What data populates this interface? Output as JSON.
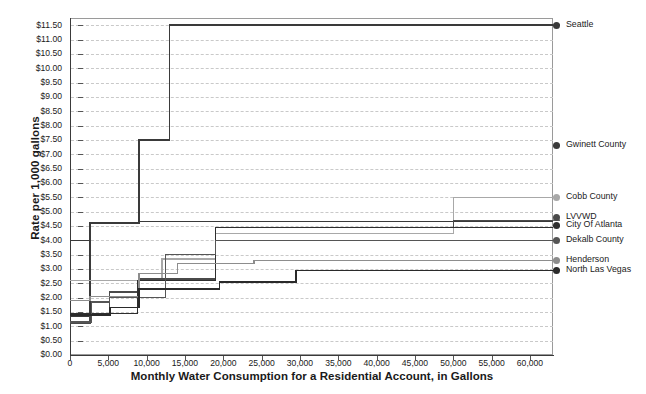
{
  "chart_data": {
    "type": "line",
    "title": "",
    "xlabel": "Monthly Water Consumption for a Residential Account, in Gallons",
    "ylabel": "Rate per 1,000 gallons",
    "xlim": [
      0,
      63000
    ],
    "ylim": [
      0,
      11.75
    ],
    "grid": true,
    "legend_position": "right",
    "step_style": "post",
    "x_ticks": [
      0,
      5000,
      10000,
      15000,
      20000,
      25000,
      30000,
      35000,
      40000,
      45000,
      50000,
      55000,
      60000
    ],
    "x_tick_labels": [
      "0",
      "5,000",
      "10,000",
      "15,000",
      "20,000",
      "25,000",
      "30,000",
      "35,000",
      "40,000",
      "45,000",
      "50,000",
      "55,000",
      "60,000"
    ],
    "y_ticks": [
      0,
      0.5,
      1,
      1.5,
      2,
      2.5,
      3,
      3.5,
      4,
      4.5,
      5,
      5.5,
      6,
      6.5,
      7,
      7.5,
      8,
      8.5,
      9,
      9.5,
      10,
      10.5,
      11,
      11.5
    ],
    "y_tick_labels": [
      "$0.00",
      "$0.50",
      "$1.00",
      "$1.50",
      "$2.00",
      "$2.50",
      "$3.00",
      "$3.50",
      "$4.00",
      "$4.50",
      "$5.00",
      "$5.50",
      "$6.00",
      "$6.50",
      "$7.00",
      "$7.50",
      "$8.00",
      "$8.50",
      "$9.00",
      "$9.50",
      "$10.00",
      "$10.50",
      "$11.00",
      "$11.50"
    ],
    "series": [
      {
        "name": "Seattle",
        "color": "#3a3a3a",
        "width": 1.5,
        "end_value": 11.5,
        "points": [
          [
            0,
            4.0
          ],
          [
            2600,
            4.0
          ],
          [
            2600,
            4.6
          ],
          [
            9000,
            4.6
          ],
          [
            9000,
            7.5
          ],
          [
            13000,
            7.5
          ],
          [
            13000,
            11.5
          ],
          [
            63000,
            11.5
          ]
        ]
      },
      {
        "name": "Gwinett County",
        "color": "#3a3a3a",
        "width": 1.5,
        "end_value": 7.3,
        "points": [
          [
            0,
            1.35
          ],
          [
            2600,
            1.35
          ],
          [
            2600,
            4.6
          ],
          [
            9000,
            4.6
          ],
          [
            9000,
            4.65
          ],
          [
            63000,
            4.65
          ]
        ]
      },
      {
        "name": "Cobb County",
        "color": "#a8a8a8",
        "width": 1.2,
        "end_value": 5.5,
        "points": [
          [
            0,
            2.6
          ],
          [
            1200,
            2.6
          ],
          [
            1200,
            2.6
          ],
          [
            12000,
            2.6
          ],
          [
            12000,
            3.35
          ],
          [
            19000,
            3.35
          ],
          [
            19000,
            4.25
          ],
          [
            50000,
            4.25
          ],
          [
            50000,
            5.5
          ],
          [
            63000,
            5.5
          ]
        ]
      },
      {
        "name": "LVVWD",
        "color": "#4a4a4a",
        "width": 1.2,
        "end_value": 4.7,
        "points": [
          [
            0,
            1.1
          ],
          [
            2600,
            1.1
          ],
          [
            2600,
            1.45
          ],
          [
            5200,
            1.45
          ],
          [
            5200,
            2.2
          ],
          [
            9000,
            2.2
          ],
          [
            9000,
            2.65
          ],
          [
            19000,
            2.65
          ],
          [
            19000,
            4.45
          ],
          [
            50000,
            4.45
          ],
          [
            50000,
            4.7
          ],
          [
            63000,
            4.7
          ]
        ]
      },
      {
        "name": "City Of Atlanta",
        "color": "#2e2e2e",
        "width": 1.4,
        "end_value": 4.5,
        "points": [
          [
            0,
            1.45
          ],
          [
            2600,
            1.45
          ],
          [
            2600,
            1.45
          ],
          [
            8800,
            1.45
          ],
          [
            8800,
            2.6
          ],
          [
            19000,
            2.6
          ],
          [
            19000,
            4.45
          ],
          [
            63000,
            4.45
          ]
        ]
      },
      {
        "name": "Dekalb County",
        "color": "#555555",
        "width": 1.2,
        "end_value": 4.0,
        "points": [
          [
            0,
            1.15
          ],
          [
            2800,
            1.15
          ],
          [
            2800,
            1.85
          ],
          [
            5200,
            1.85
          ],
          [
            5200,
            2.0
          ],
          [
            12500,
            2.0
          ],
          [
            12500,
            3.5
          ],
          [
            19000,
            3.5
          ],
          [
            19000,
            4.0
          ],
          [
            63000,
            4.0
          ]
        ]
      },
      {
        "name": "Henderson",
        "color": "#8d8d8d",
        "width": 1.2,
        "end_value": 3.3,
        "points": [
          [
            0,
            1.9
          ],
          [
            2600,
            1.9
          ],
          [
            2600,
            2.05
          ],
          [
            9000,
            2.05
          ],
          [
            9000,
            2.85
          ],
          [
            14000,
            2.85
          ],
          [
            14000,
            3.2
          ],
          [
            24000,
            3.2
          ],
          [
            24000,
            3.3
          ],
          [
            63000,
            3.3
          ]
        ]
      },
      {
        "name": "North Las Vegas",
        "color": "#2a2a2a",
        "width": 1.4,
        "end_value": 2.95,
        "points": [
          [
            0,
            1.4
          ],
          [
            5200,
            1.4
          ],
          [
            5200,
            1.65
          ],
          [
            9000,
            1.65
          ],
          [
            9000,
            2.3
          ],
          [
            19500,
            2.3
          ],
          [
            19500,
            2.55
          ],
          [
            29500,
            2.55
          ],
          [
            29500,
            2.95
          ],
          [
            63000,
            2.95
          ]
        ]
      }
    ],
    "legend_entries": [
      {
        "label": "Seattle",
        "value": 11.5,
        "color": "#3a3a3a"
      },
      {
        "label": "Gwinett County",
        "value": 7.3,
        "color": "#3a3a3a"
      },
      {
        "label": "Cobb County",
        "value": 5.5,
        "color": "#a8a8a8"
      },
      {
        "label": "LVVWD",
        "value": 4.78,
        "color": "#4a4a4a"
      },
      {
        "label": "City Of Atlanta",
        "value": 4.5,
        "color": "#2e2e2e"
      },
      {
        "label": "Dekalb County",
        "value": 4.0,
        "color": "#555555"
      },
      {
        "label": "Henderson",
        "value": 3.3,
        "color": "#8d8d8d"
      },
      {
        "label": "North Las Vegas",
        "value": 2.95,
        "color": "#2a2a2a"
      }
    ]
  }
}
